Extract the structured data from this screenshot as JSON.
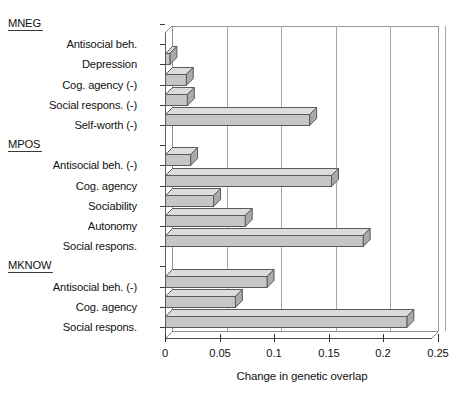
{
  "chart_data": {
    "type": "bar",
    "orientation": "horizontal",
    "title": "",
    "xlabel": "Change in genetic overlap",
    "ylabel": "",
    "xlim": [
      0,
      0.25
    ],
    "xticks": [
      "0",
      "0.05",
      "0.1",
      "0.15",
      "0.2",
      "0.25"
    ],
    "xtick_values": [
      0,
      0.05,
      0.1,
      0.15,
      0.2,
      0.25
    ],
    "grid": "vertical",
    "legend": "none",
    "style": "3d-isometric-bars",
    "groups": [
      {
        "name": "MNEG",
        "categories": [
          "Antisocial beh.",
          "Depression",
          "Cog. agency (-)",
          "Social respons. (-)",
          "Self-worth (-)"
        ],
        "values": [
          0.0,
          0.004,
          0.019,
          0.02,
          0.132
        ]
      },
      {
        "name": "MPOS",
        "categories": [
          "Antisocial beh. (-)",
          "Cog. agency",
          "Sociability",
          "Autonomy",
          "Social respons."
        ],
        "values": [
          0.023,
          0.152,
          0.044,
          0.073,
          0.181
        ]
      },
      {
        "name": "MKNOW",
        "categories": [
          "Antisocial beh. (-)",
          "Cog. agency",
          "Social respons."
        ],
        "values": [
          0.093,
          0.064,
          0.221
        ]
      }
    ],
    "categories": [
      "Antisocial beh.",
      "Depression",
      "Cog. agency (-)",
      "Social respons. (-)",
      "Self-worth (-)",
      "Antisocial beh. (-)",
      "Cog. agency",
      "Sociability",
      "Autonomy",
      "Social respons.",
      "Antisocial beh. (-)",
      "Cog. agency",
      "Social respons."
    ],
    "values": [
      0.0,
      0.004,
      0.019,
      0.02,
      0.132,
      0.023,
      0.152,
      0.044,
      0.073,
      0.181,
      0.093,
      0.064,
      0.221
    ]
  },
  "axis": {
    "x_title": "Change in genetic overlap",
    "tick_0": "0",
    "tick_1": "0.05",
    "tick_2": "0.1",
    "tick_3": "0.15",
    "tick_4": "0.2",
    "tick_5": "0.25"
  },
  "rows": [
    {
      "kind": "group",
      "label": "MNEG"
    },
    {
      "kind": "cat",
      "label": "Antisocial beh.",
      "value": 0.0
    },
    {
      "kind": "cat",
      "label": "Depression",
      "value": 0.004
    },
    {
      "kind": "cat",
      "label": "Cog. agency (-)",
      "value": 0.019
    },
    {
      "kind": "cat",
      "label": "Social respons. (-)",
      "value": 0.02
    },
    {
      "kind": "cat",
      "label": "Self-worth (-)",
      "value": 0.132
    },
    {
      "kind": "group",
      "label": "MPOS"
    },
    {
      "kind": "cat",
      "label": "Antisocial beh. (-)",
      "value": 0.023
    },
    {
      "kind": "cat",
      "label": "Cog. agency",
      "value": 0.152
    },
    {
      "kind": "cat",
      "label": "Sociability",
      "value": 0.044
    },
    {
      "kind": "cat",
      "label": "Autonomy",
      "value": 0.073
    },
    {
      "kind": "cat",
      "label": "Social respons.",
      "value": 0.181
    },
    {
      "kind": "group",
      "label": "MKNOW"
    },
    {
      "kind": "cat",
      "label": "Antisocial beh. (-)",
      "value": 0.093
    },
    {
      "kind": "cat",
      "label": "Cog. agency",
      "value": 0.064
    },
    {
      "kind": "cat",
      "label": "Social respons.",
      "value": 0.221
    }
  ],
  "colors": {
    "bar_face": "#c6c6c6",
    "bar_top": "#dcdcdc",
    "bar_side": "#aaaaaa",
    "bar_edge": "#5a5a5a",
    "grid": "#a8a8a8",
    "axis": "#2e2e2e",
    "text": "#111111",
    "background": "#ffffff"
  }
}
